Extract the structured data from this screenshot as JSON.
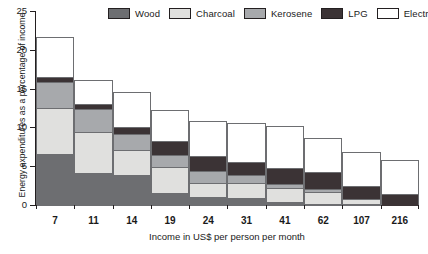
{
  "chart_data": {
    "type": "bar",
    "title": "",
    "subtitle": "",
    "stacked": true,
    "xlabel": "Income in US$ per person per month",
    "ylabel": "Energy expenditures as a percentage of income",
    "categories": [
      "7",
      "11",
      "14",
      "19",
      "24",
      "31",
      "41",
      "62",
      "107",
      "216"
    ],
    "ylim": [
      0,
      25
    ],
    "yticks": [
      0,
      5,
      10,
      15,
      20,
      25
    ],
    "ytick_labels": [
      "0",
      "5",
      "10",
      "15",
      "20",
      "25"
    ],
    "grid": false,
    "legend_position": "top",
    "series": [
      {
        "name": "Wood",
        "color": "#6d6e71",
        "values": [
          6.7,
          4.3,
          4.0,
          1.7,
          1.2,
          1.0,
          0.5,
          0.3,
          0.2,
          0.0
        ]
      },
      {
        "name": "Charcoal",
        "color": "#e0e0de",
        "values": [
          6.0,
          5.4,
          3.3,
          3.5,
          1.9,
          2.1,
          1.9,
          1.6,
          0.8,
          0.0
        ]
      },
      {
        "name": "Kerosene",
        "color": "#a7a9ac",
        "values": [
          3.6,
          3.0,
          2.3,
          1.6,
          1.7,
          1.1,
          0.7,
          0.5,
          0.2,
          0.0
        ]
      },
      {
        "name": "LPG",
        "color": "#3b3335",
        "values": [
          0.7,
          0.8,
          1.0,
          2.0,
          2.1,
          1.9,
          2.2,
          2.4,
          1.8,
          1.6
        ]
      },
      {
        "name": "Electricity",
        "color": "#ffffff",
        "values": [
          5.3,
          3.2,
          4.6,
          4.1,
          4.6,
          5.1,
          5.5,
          4.5,
          4.5,
          4.5
        ]
      }
    ],
    "totals": [
      22.3,
      16.7,
      15.2,
      12.9,
      11.5,
      11.2,
      10.8,
      9.3,
      7.5,
      6.1
    ]
  },
  "legend": {
    "items": [
      {
        "label": "Wood"
      },
      {
        "label": "Charcoal"
      },
      {
        "label": "Kerosene"
      },
      {
        "label": "LPG"
      },
      {
        "label": "Electricity"
      }
    ]
  },
  "colors": {
    "wood": "#6d6e71",
    "charcoal": "#e0e0de",
    "kerosene": "#a7a9ac",
    "lpg": "#3b3335",
    "electricity": "#ffffff",
    "axis": "#231f20",
    "outline": "#6d6e71",
    "background": "#ffffff"
  }
}
